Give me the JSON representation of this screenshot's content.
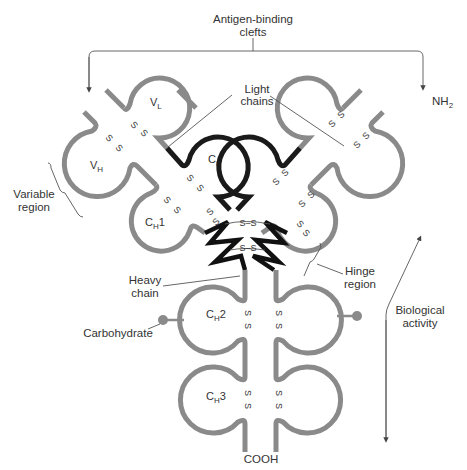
{
  "title": "Antigen-binding clefts",
  "title_lines": [
    "Antigen-binding",
    "clefts"
  ],
  "colors": {
    "heavy_chain": "#8a8a8a",
    "light_chain_constant": "#1a1a1a",
    "hinge": "#111111",
    "label_text": "#333333",
    "leader_lines": "#555555",
    "background": "#ffffff"
  },
  "labels": {
    "light_chains": [
      "Light",
      "chains"
    ],
    "nh2": "NH",
    "nh2_sub": "2",
    "variable_region": [
      "Variable",
      "region"
    ],
    "hinge_region": [
      "Hinge",
      "region"
    ],
    "heavy_chain": [
      "Heavy",
      "chain"
    ],
    "carbohydrate": "Carbohydrate",
    "biological_activity": [
      "Biological",
      "activity"
    ],
    "cooh": "COOH"
  },
  "domains": {
    "vl": {
      "main": "V",
      "sub": "L"
    },
    "vh": {
      "main": "V",
      "sub": "H"
    },
    "cl": {
      "main": "C",
      "sub": "L"
    },
    "ch1": {
      "main": "C",
      "sub": "H",
      "suffix": "1"
    },
    "ch2": {
      "main": "C",
      "sub": "H",
      "suffix": "2"
    },
    "ch3": {
      "main": "C",
      "sub": "H",
      "suffix": "3"
    }
  },
  "disulfide": {
    "symbol": "S",
    "bond": "S–S",
    "hinge_bonds": [
      "S–S",
      "S–S"
    ]
  }
}
